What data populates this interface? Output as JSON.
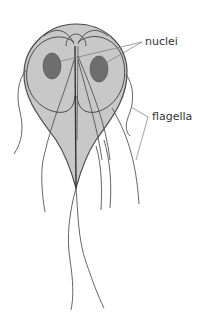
{
  "figure": {
    "labels": {
      "nuclei": "nuclei",
      "flagella": "flagella"
    },
    "colors": {
      "body_fill": "#c8c8c8",
      "body_stroke": "#4a4a4a",
      "nucleus_fill": "#6e6e6e",
      "line": "#555555",
      "label_text": "#333333",
      "leader_line": "#777777"
    }
  }
}
